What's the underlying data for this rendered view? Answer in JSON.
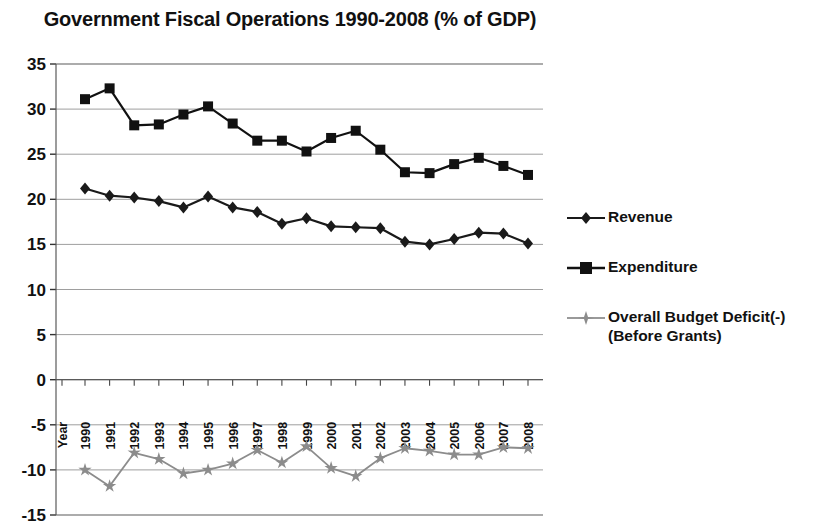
{
  "chart_data": {
    "type": "line",
    "title": "Government Fiscal Operations 1990-2008 (% of GDP)",
    "xlabel": "Year",
    "ylabel": "",
    "ylim": [
      -15,
      35
    ],
    "ytick_step": 5,
    "yticks": [
      "35",
      "30",
      "25",
      "20",
      "15",
      "10",
      "5",
      "0",
      "-5",
      "-10",
      "-15"
    ],
    "grid": true,
    "legend_position": "right",
    "axis_label": "Year",
    "categories": [
      "1990",
      "1991",
      "1992",
      "1993",
      "1994",
      "1995",
      "1996",
      "1997",
      "1998",
      "1999",
      "2000",
      "2001",
      "2002",
      "2003",
      "2004",
      "2005",
      "2006",
      "2007",
      "2008"
    ],
    "series": [
      {
        "name": "Revenue",
        "marker": "diamond",
        "color": "#1a1a1a",
        "values": [
          21.2,
          20.4,
          20.2,
          19.8,
          19.1,
          20.3,
          19.1,
          18.6,
          17.3,
          17.9,
          17.0,
          16.9,
          16.8,
          15.3,
          15.0,
          15.6,
          16.3,
          16.2,
          15.1
        ]
      },
      {
        "name": "Expenditure",
        "marker": "square",
        "color": "#111111",
        "values": [
          31.1,
          32.3,
          28.2,
          28.3,
          29.4,
          30.3,
          28.4,
          26.5,
          26.5,
          25.3,
          26.8,
          27.6,
          25.5,
          23.0,
          22.9,
          23.9,
          24.6,
          23.7,
          22.7
        ]
      },
      {
        "name": "Overall Budget Deficit(-)\n(Before Grants)",
        "marker": "star",
        "color": "#8c8c8c",
        "values": [
          -10.0,
          -11.8,
          -8.1,
          -8.8,
          -10.4,
          -10.0,
          -9.3,
          -7.8,
          -9.2,
          -7.4,
          -9.8,
          -10.7,
          -8.7,
          -7.6,
          -7.9,
          -8.3,
          -8.3,
          -7.5,
          -7.6
        ]
      }
    ]
  },
  "legend": {
    "items": [
      {
        "label": "Revenue",
        "marker": "diamond-marker-icon"
      },
      {
        "label": "Expenditure",
        "marker": "square-marker-icon"
      },
      {
        "label": "Overall Budget Deficit(-)\n(Before Grants)",
        "marker": "star-marker-icon"
      }
    ]
  }
}
